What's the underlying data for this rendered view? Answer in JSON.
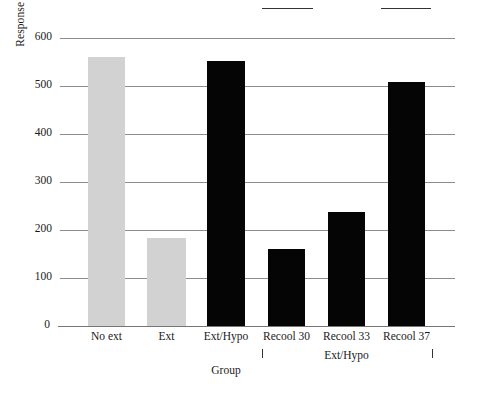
{
  "chart_data": {
    "type": "bar",
    "title": "",
    "xlabel": "Group",
    "ylabel": "Response latency (sec)",
    "categories": [
      "No ext",
      "Ext",
      "Ext/Hypo",
      "Recool 30",
      "Recool 33",
      "Recool 37"
    ],
    "values": [
      560,
      184,
      553,
      160,
      238,
      508
    ],
    "bar_colors": [
      "#d2d2d2",
      "#d2d2d2",
      "#050505",
      "#050505",
      "#050505",
      "#050505"
    ],
    "ylim": [
      0,
      600
    ],
    "yticks": [
      0,
      100,
      200,
      300,
      400,
      500,
      600
    ],
    "ytick_labels": [
      "0",
      "100",
      "200",
      "300",
      "400",
      "500",
      "600"
    ],
    "grid": true,
    "grid_axis": "y",
    "legend": "none",
    "annotations": [
      {
        "type": "bracket",
        "label": "Ext/Hypo",
        "spans_categories": [
          "Recool 30",
          "Recool 33",
          "Recool 37"
        ]
      }
    ]
  },
  "axes": {
    "y_title": "Response latency (sec)",
    "x_title": "Group"
  }
}
